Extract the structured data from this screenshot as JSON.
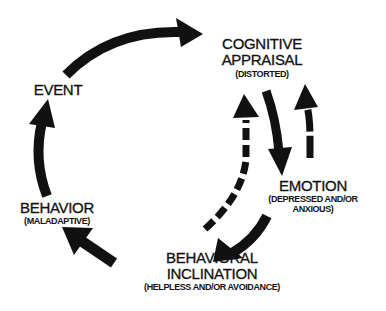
{
  "diagram": {
    "type": "cycle",
    "colors": {
      "ink": "#111111",
      "background": "#ffffff"
    },
    "nodes": {
      "event": {
        "title": "EVENT"
      },
      "cognitive_appraisal": {
        "title_line1": "COGNITIVE",
        "title_line2": "APPRAISAL",
        "subtitle": "(DISTORTED)"
      },
      "emotion": {
        "title": "EMOTION",
        "subtitle_line1": "(DEPRESSED AND/OR",
        "subtitle_line2": "ANXIOUS)"
      },
      "behavioral_inclination": {
        "title_line1": "BEHAVIORAL",
        "title_line2": "INCLINATION",
        "subtitle": "(HELPLESS AND/OR AVOIDANCE)"
      },
      "behavior": {
        "title": "BEHAVIOR",
        "subtitle": "(MALADAPTIVE)"
      }
    },
    "edges": [
      {
        "from": "EVENT",
        "to": "COGNITIVE APPRAISAL",
        "style": "solid"
      },
      {
        "from": "COGNITIVE APPRAISAL",
        "to": "EMOTION",
        "style": "solid"
      },
      {
        "from": "EMOTION",
        "to": "COGNITIVE APPRAISAL",
        "style": "dashed"
      },
      {
        "from": "BEHAVIORAL INCLINATION",
        "to": "COGNITIVE APPRAISAL",
        "style": "dashed"
      },
      {
        "from": "EMOTION",
        "to": "BEHAVIORAL INCLINATION",
        "style": "solid"
      },
      {
        "from": "BEHAVIORAL INCLINATION",
        "to": "BEHAVIOR",
        "style": "solid"
      },
      {
        "from": "BEHAVIOR",
        "to": "EVENT",
        "style": "solid"
      }
    ]
  }
}
